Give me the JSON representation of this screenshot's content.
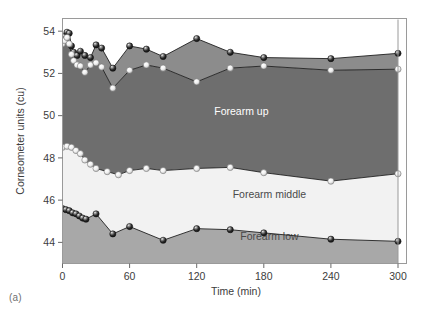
{
  "figure": {
    "caption": "(a)",
    "background": "#ffffff",
    "frame_color": "#9a9a9a"
  },
  "chart_data": {
    "type": "area",
    "title": "",
    "xlabel": "Time (min)",
    "ylabel": "Corneometer units (cu)",
    "xlim": [
      0,
      300
    ],
    "ylim": [
      43.0,
      54.6
    ],
    "xticks": [
      0,
      60,
      120,
      180,
      240,
      300
    ],
    "yticks": [
      44,
      46,
      48,
      50,
      52,
      54
    ],
    "xtick_labels": [
      "0",
      "60",
      "120",
      "180",
      "240",
      "300"
    ],
    "ytick_labels": [
      "44",
      "46",
      "48",
      "50",
      "52",
      "54"
    ],
    "grid": false,
    "legend": "inline-area-labels",
    "stacked": false,
    "band_labels": [
      {
        "name": "Upper arm",
        "color": "#ffffff",
        "x": 195,
        "y": 52.95
      },
      {
        "name": "Forearm up",
        "color": "#ffffff",
        "x": 160,
        "y": 50.05
      },
      {
        "name": "Forearm middle",
        "color": "#5a5a5a",
        "x": 185,
        "y": 46.1
      },
      {
        "name": "Forearm low",
        "color": "#4a4a4a",
        "x": 185,
        "y": 44.1
      }
    ],
    "band_fills": {
      "upper_arm_band": "#8c8c8c",
      "forearm_up_band": "#6e6e6e",
      "forearm_middle_band": "#f2f2f2",
      "forearm_low_band": "#a8a8a8"
    },
    "series": [
      {
        "name": "Upper arm",
        "marker": "sphere-dark",
        "x": [
          0,
          2,
          4,
          6,
          8,
          10,
          13,
          16,
          20,
          25,
          30,
          35,
          45,
          60,
          75,
          90,
          120,
          150,
          180,
          240,
          300
        ],
        "values": [
          53.6,
          53.75,
          53.95,
          53.9,
          53.3,
          53.0,
          52.85,
          53.05,
          52.85,
          52.75,
          53.35,
          53.2,
          52.25,
          53.3,
          53.15,
          52.8,
          53.65,
          53.0,
          52.75,
          52.7,
          52.95
        ]
      },
      {
        "name": "Forearm up",
        "marker": "sphere-light",
        "x": [
          0,
          2,
          4,
          6,
          8,
          10,
          13,
          16,
          20,
          25,
          30,
          35,
          45,
          60,
          75,
          90,
          120,
          150,
          180,
          240,
          300
        ],
        "values": [
          53.4,
          53.55,
          53.7,
          53.4,
          52.9,
          52.6,
          52.4,
          52.35,
          52.05,
          52.4,
          52.5,
          52.3,
          51.3,
          52.15,
          52.4,
          52.25,
          51.6,
          52.25,
          52.35,
          52.15,
          52.2
        ]
      },
      {
        "name": "Forearm middle",
        "marker": "sphere-light",
        "x": [
          0,
          4,
          8,
          12,
          16,
          20,
          25,
          30,
          40,
          50,
          60,
          75,
          90,
          120,
          150,
          180,
          240,
          300
        ],
        "values": [
          48.5,
          48.55,
          48.5,
          48.35,
          48.2,
          47.9,
          47.7,
          47.5,
          47.35,
          47.2,
          47.4,
          47.5,
          47.4,
          47.5,
          47.55,
          47.3,
          46.9,
          47.25
        ]
      },
      {
        "name": "Forearm low",
        "marker": "sphere-dark",
        "x": [
          0,
          3,
          6,
          9,
          12,
          15,
          18,
          21,
          30,
          45,
          60,
          90,
          120,
          150,
          180,
          240,
          300
        ],
        "values": [
          45.6,
          45.55,
          45.5,
          45.4,
          45.35,
          45.25,
          45.15,
          45.1,
          45.35,
          44.4,
          44.75,
          44.1,
          44.65,
          44.6,
          44.45,
          44.15,
          44.05
        ]
      }
    ]
  }
}
